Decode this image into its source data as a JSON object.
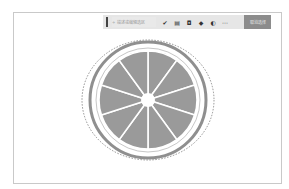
{
  "toolbar": {
    "prompt_placeholder": "描述或编辑选区",
    "prompt_icon": "sparkle-icon",
    "tools": [
      {
        "name": "brush-tool",
        "glyph": "✔"
      },
      {
        "name": "layers-tool",
        "glyph": "▤"
      },
      {
        "name": "frame-tool",
        "glyph": "◘"
      },
      {
        "name": "fill-tool",
        "glyph": "◆"
      },
      {
        "name": "adjust-tool",
        "glyph": "◐"
      },
      {
        "name": "more-tool",
        "glyph": "⋯"
      }
    ],
    "action_label": "取消选择"
  },
  "canvas": {
    "subject": "citrus slice",
    "segments": 10,
    "colors": {
      "flesh": "#9a9a9a",
      "rind": "#8f8f8f",
      "pith": "#ffffff",
      "selection": "#777777"
    }
  }
}
